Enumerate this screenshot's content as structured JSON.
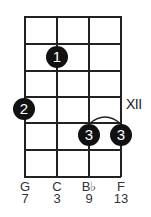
{
  "diagram": {
    "type": "chord-fretboard",
    "strings": [
      {
        "note": "G",
        "degree": "7"
      },
      {
        "note": "C",
        "degree": "3"
      },
      {
        "note": "B♭",
        "degree": "9"
      },
      {
        "note": "F",
        "degree": "13"
      }
    ],
    "fret_rows": 6,
    "position_marker": "XII",
    "fingers": [
      {
        "finger": "1",
        "string": "C",
        "row": 2
      },
      {
        "finger": "2",
        "string": "G",
        "row": 4
      },
      {
        "finger": "3",
        "string": "B♭",
        "row": 5
      },
      {
        "finger": "3",
        "string": "F",
        "row": 5
      }
    ],
    "barre": {
      "finger": "3",
      "from_string": "B♭",
      "to_string": "F",
      "row": 5
    },
    "colors": {
      "lines": "#222222",
      "dots": "#111111",
      "dot_text": "#ffffff"
    }
  }
}
